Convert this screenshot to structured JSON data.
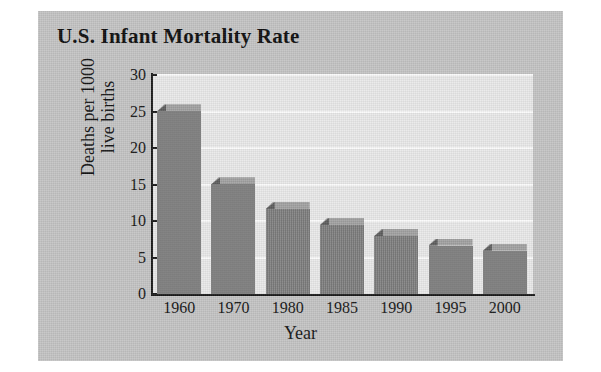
{
  "figure": {
    "background_color": "#c4c4c4",
    "plot_background_color": "#e9e9e9",
    "bar_color": "#7e7e7e",
    "bar_top_color": "#a2a2a2",
    "gridline_color": "#fbfbfb",
    "axis_color": "#1a1a1a"
  },
  "chart_data": {
    "type": "bar",
    "title": "U.S. Infant Mortality Rate",
    "xlabel": "Year",
    "ylabel": "Deaths per 1000 live births",
    "ylabel_line1": "Deaths per 1000",
    "ylabel_line2": "live births",
    "categories": [
      "1960",
      "1970",
      "1980",
      "1985",
      "1990",
      "1995",
      "2000"
    ],
    "values": [
      26.0,
      16.0,
      12.6,
      10.4,
      8.9,
      7.6,
      6.9
    ],
    "yticks": [
      0,
      5,
      10,
      15,
      20,
      25,
      30
    ],
    "ytick_labels": [
      "0",
      "5",
      "10",
      "15",
      "20",
      "25",
      "30"
    ],
    "ylim": [
      0,
      30
    ],
    "grid": true,
    "legend": false,
    "style": "3d-bar",
    "series": [
      {
        "name": "Infant mortality rate",
        "values": [
          26.0,
          16.0,
          12.6,
          10.4,
          8.9,
          7.6,
          6.9
        ]
      }
    ]
  }
}
